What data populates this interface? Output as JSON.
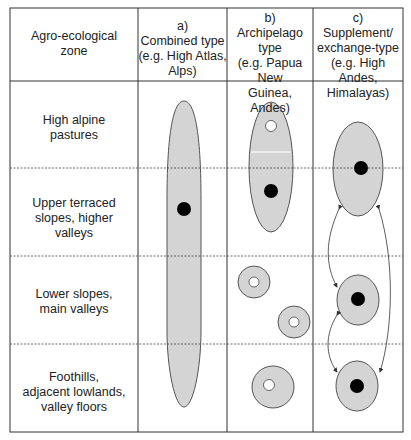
{
  "header": {
    "zone": "Agro-ecological zone",
    "zone_lines": [
      "Agro-ecological",
      "zone"
    ],
    "col_a": [
      "a)",
      "Combined type",
      "(e.g. High Atlas,",
      "Alps)"
    ],
    "col_b": [
      "b)",
      "Archipelago",
      "type",
      "(e.g. Papua New",
      "Guinea, Andes)"
    ],
    "col_c": [
      "c)",
      "Supplement/",
      "exchange-type",
      "(e.g. High Andes,",
      "Himalayas)"
    ]
  },
  "rows": [
    {
      "label": [
        "High alpine",
        "pastures"
      ]
    },
    {
      "label": [
        "Upper terraced",
        "slopes, higher",
        "valleys"
      ]
    },
    {
      "label": [
        "Lower slopes,",
        "main valleys"
      ]
    },
    {
      "label": [
        "Foothills,",
        "adjacent lowlands,",
        "valley floors"
      ]
    }
  ],
  "colors": {
    "fill": "#d4d4d4",
    "stroke": "#555555",
    "dot_black": "#000000",
    "dot_white": "#ffffff",
    "border": "#333333"
  }
}
